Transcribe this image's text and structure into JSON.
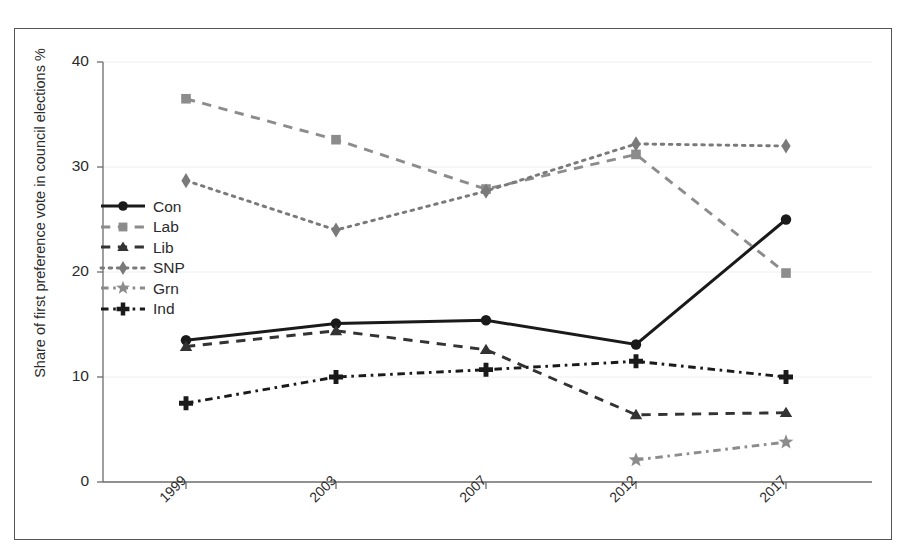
{
  "chart_data": {
    "type": "line",
    "title": "",
    "xlabel": "",
    "ylabel": "Share of first preference vote in council elections %",
    "categories": [
      "1999",
      "2003",
      "2007",
      "2012",
      "2017"
    ],
    "ylim": [
      0,
      40
    ],
    "yticks": [
      "0",
      "10",
      "20",
      "30",
      "40"
    ],
    "grid": false,
    "legend_position": "inside-left",
    "series": [
      {
        "name": "Con",
        "marker": "circle",
        "linestyle": "solid",
        "color": "#1a1a1a",
        "values": [
          13.5,
          15.1,
          15.4,
          13.1,
          25.0
        ]
      },
      {
        "name": "Lab",
        "marker": "square",
        "linestyle": "dashed",
        "color": "#8c8c8c",
        "values": [
          36.5,
          32.6,
          27.9,
          31.2,
          19.9
        ]
      },
      {
        "name": "Lib",
        "marker": "triangle",
        "linestyle": "dashed",
        "color": "#333333",
        "values": [
          12.9,
          14.4,
          12.6,
          6.4,
          6.6
        ]
      },
      {
        "name": "SNP",
        "marker": "diamond",
        "linestyle": "dotted",
        "color": "#7a7a7a",
        "values": [
          28.7,
          24.0,
          27.7,
          32.2,
          32.0
        ]
      },
      {
        "name": "Grn",
        "marker": "star",
        "linestyle": "dashdot",
        "color": "#8c8c8c",
        "values": [
          null,
          null,
          null,
          2.1,
          3.8
        ]
      },
      {
        "name": "Ind",
        "marker": "plus",
        "linestyle": "dashdot",
        "color": "#1a1a1a",
        "values": [
          7.5,
          10.0,
          10.7,
          11.5,
          10.0
        ]
      }
    ]
  },
  "legend": {
    "items": [
      {
        "label": "Con"
      },
      {
        "label": "Lab"
      },
      {
        "label": "Lib"
      },
      {
        "label": "SNP"
      },
      {
        "label": "Grn"
      },
      {
        "label": "Ind"
      }
    ]
  }
}
